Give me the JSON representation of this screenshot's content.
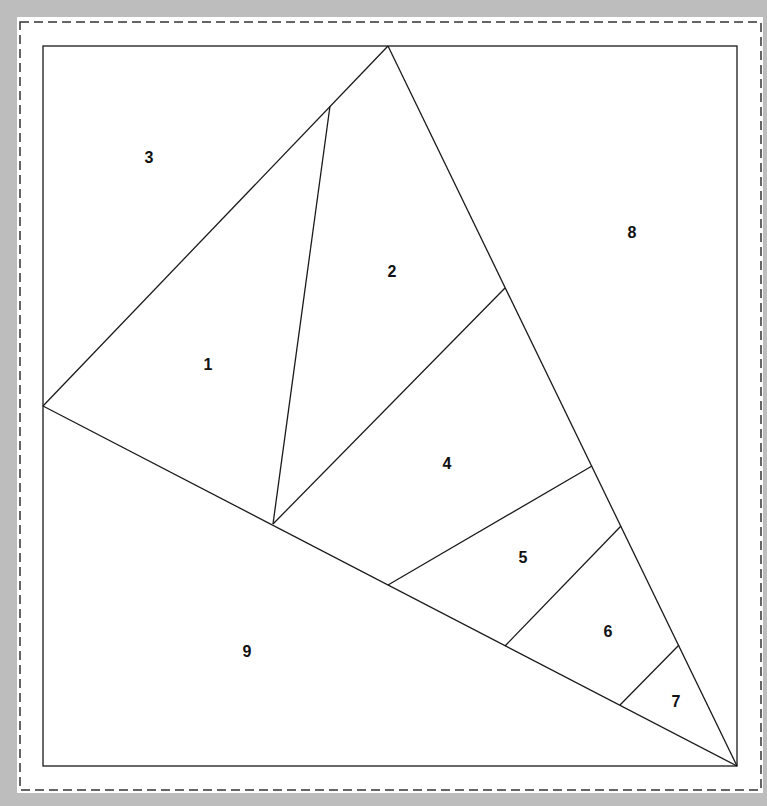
{
  "diagram": {
    "type": "foundation paper piecing pattern",
    "background_color": "#bdbdbd",
    "paper_color": "#ffffff",
    "line_color": "#1a1a1a",
    "seam_allowance_line": {
      "x1": 20,
      "y1": 22,
      "x2": 761,
      "y2": 790,
      "style": "dashed",
      "color": "#333333"
    },
    "block_square": {
      "x1": 43,
      "y1": 46,
      "x2": 737,
      "y2": 766
    },
    "vertices": {
      "apex": [
        388,
        46
      ],
      "left": [
        43,
        406
      ],
      "bottom_right": [
        737,
        766
      ],
      "a": [
        330,
        106
      ],
      "b": [
        273,
        524
      ],
      "c": [
        505,
        288
      ],
      "d": [
        592,
        466
      ],
      "e": [
        388,
        585
      ],
      "f": [
        621,
        526
      ],
      "g": [
        505,
        646
      ],
      "h": [
        679,
        645
      ],
      "i": [
        620,
        705
      ]
    },
    "segments": [
      [
        "left",
        "apex"
      ],
      [
        "apex",
        "bottom_right"
      ],
      [
        "left",
        "bottom_right"
      ],
      [
        "a",
        "b"
      ],
      [
        "c",
        "b"
      ],
      [
        "d",
        "e"
      ],
      [
        "f",
        "g"
      ],
      [
        "h",
        "i"
      ]
    ],
    "pieces": [
      {
        "label": "1",
        "x": 208,
        "y": 364
      },
      {
        "label": "2",
        "x": 392,
        "y": 271
      },
      {
        "label": "3",
        "x": 149,
        "y": 157
      },
      {
        "label": "4",
        "x": 447,
        "y": 463
      },
      {
        "label": "5",
        "x": 523,
        "y": 557
      },
      {
        "label": "6",
        "x": 608,
        "y": 631
      },
      {
        "label": "7",
        "x": 676,
        "y": 701
      },
      {
        "label": "8",
        "x": 632,
        "y": 232
      },
      {
        "label": "9",
        "x": 247,
        "y": 651
      }
    ]
  }
}
